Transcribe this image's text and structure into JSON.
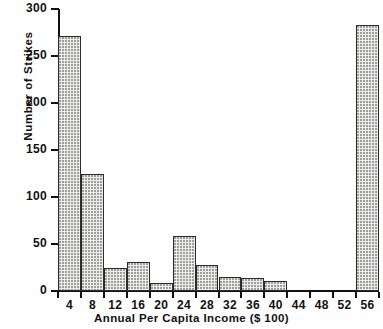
{
  "chart_data": {
    "type": "bar",
    "title": "",
    "xlabel": "Annual Per Capita Income ($ 100)",
    "ylabel": "Number of Strikes",
    "categories": [
      "4",
      "8",
      "12",
      "16",
      "20",
      "24",
      "28",
      "32",
      "36",
      "40",
      "44",
      "48",
      "52",
      "56"
    ],
    "values": [
      271,
      125,
      24,
      31,
      9,
      58,
      28,
      15,
      14,
      11,
      0,
      0,
      0,
      283
    ],
    "xtick_labels": [
      "4",
      "8",
      "12",
      "16",
      "20",
      "24",
      "28",
      "32",
      "36",
      "40",
      "44",
      "48",
      "52",
      "56"
    ],
    "ytick_labels": [
      "300",
      "250",
      "200",
      "150",
      "100",
      "50",
      "0"
    ],
    "ytick_values": [
      300,
      250,
      200,
      150,
      100,
      50,
      0
    ],
    "ylim": [
      0,
      300
    ],
    "xlim": [
      2,
      58
    ],
    "bar_width_units": 4,
    "grid": false,
    "legend": null,
    "bar_fill_color": "#ececeb",
    "bar_edge_color": "#2b2b2b",
    "axis_color": "#111111",
    "background_color": "#ffffff"
  }
}
